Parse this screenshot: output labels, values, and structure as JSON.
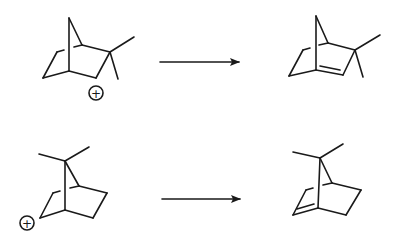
{
  "diagram": {
    "type": "reaction-scheme",
    "colors": {
      "ink": "#1a1a1a",
      "background": "#ffffff"
    },
    "reactions": [
      {
        "reactant": {
          "name": "dimethyl-norbornyl-cation-2",
          "charge_symbol": "+"
        },
        "arrow": "right-arrow",
        "product": {
          "name": "dimethyl-norbornene-camphene-like"
        }
      },
      {
        "reactant": {
          "name": "7,7-dimethyl-norbornyl-cation",
          "charge_symbol": "+"
        },
        "arrow": "right-arrow",
        "product": {
          "name": "7,7-dimethyl-norbornene"
        }
      }
    ]
  }
}
